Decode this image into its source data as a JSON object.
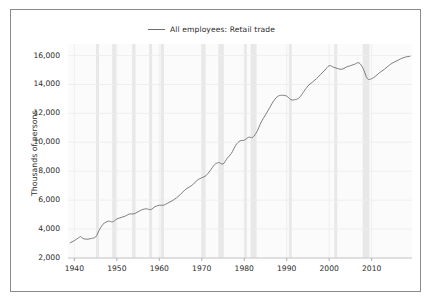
{
  "figure": {
    "background_color": "#ffffff",
    "border_color": "#8a8a8a",
    "plot_background_color": "#fbfbfb"
  },
  "legend": {
    "label": "All employees: Retail trade",
    "line_color": "#6f6f6f",
    "position": "top-center"
  },
  "axis": {
    "ylabel": "Thousands of persons",
    "xlabel": "",
    "ytick_labels": [
      "2,000",
      "4,000",
      "6,000",
      "8,000",
      "10,000",
      "12,000",
      "14,000",
      "16,000"
    ],
    "xtick_labels": [
      "1940",
      "1950",
      "1960",
      "1970",
      "1980",
      "1990",
      "2000",
      "2010"
    ]
  },
  "chart_data": {
    "type": "line",
    "title": "",
    "subtitle": "",
    "xlabel": "",
    "ylabel": "Thousands of persons",
    "xlim": [
      1938.5,
      2019.5
    ],
    "ylim": [
      2000,
      16800
    ],
    "yticks": [
      2000,
      4000,
      6000,
      8000,
      10000,
      12000,
      14000,
      16000
    ],
    "xticks": [
      1940,
      1950,
      1960,
      1970,
      1980,
      1990,
      2000,
      2010
    ],
    "grid": true,
    "legend_position": "upper center",
    "series": [
      {
        "name": "All employees: Retail trade",
        "color": "#6f6f6f",
        "units": "Thousands of persons",
        "x": [
          1939,
          1940,
          1941,
          1941.5,
          1942,
          1943,
          1944,
          1945,
          1945.8,
          1946.5,
          1947,
          1948,
          1949,
          1950,
          1951,
          1952,
          1953,
          1954,
          1955,
          1956,
          1957,
          1958,
          1959,
          1960,
          1961,
          1962,
          1963,
          1964,
          1965,
          1966,
          1967,
          1968,
          1969,
          1970,
          1971,
          1972,
          1973,
          1974,
          1975,
          1976,
          1977,
          1978,
          1979,
          1980,
          1981,
          1982,
          1983,
          1984,
          1985,
          1986,
          1987,
          1988,
          1989,
          1990,
          1991,
          1992,
          1993,
          1994,
          1995,
          1996,
          1997,
          1998,
          1999,
          2000,
          2001,
          2002,
          2003,
          2004,
          2005,
          2006,
          2007,
          2008,
          2009,
          2010,
          2011,
          2012,
          2013,
          2014,
          2015,
          2016,
          2017,
          2018,
          2019
        ],
        "y": [
          3050,
          3200,
          3400,
          3480,
          3350,
          3300,
          3350,
          3450,
          3900,
          4250,
          4400,
          4550,
          4500,
          4700,
          4800,
          4900,
          5050,
          5050,
          5200,
          5350,
          5400,
          5350,
          5550,
          5650,
          5650,
          5800,
          5950,
          6150,
          6400,
          6700,
          6900,
          7100,
          7400,
          7550,
          7700,
          8050,
          8450,
          8600,
          8500,
          8900,
          9250,
          9800,
          10100,
          10150,
          10350,
          10350,
          10750,
          11400,
          11900,
          12400,
          12900,
          13200,
          13250,
          13200,
          12950,
          12950,
          13100,
          13500,
          13900,
          14150,
          14400,
          14700,
          15000,
          15300,
          15200,
          15100,
          15050,
          15200,
          15300,
          15400,
          15500,
          15100,
          14400,
          14400,
          14600,
          14850,
          15050,
          15300,
          15500,
          15650,
          15800,
          15900,
          15950
        ]
      }
    ],
    "recession_bands": [
      {
        "start": 1945.1,
        "end": 1945.8
      },
      {
        "start": 1948.9,
        "end": 1949.8
      },
      {
        "start": 1953.6,
        "end": 1954.4
      },
      {
        "start": 1957.6,
        "end": 1958.3
      },
      {
        "start": 1960.3,
        "end": 1961.1
      },
      {
        "start": 1969.9,
        "end": 1970.9
      },
      {
        "start": 1973.9,
        "end": 1975.2
      },
      {
        "start": 1980.0,
        "end": 1980.6
      },
      {
        "start": 1981.5,
        "end": 1982.9
      },
      {
        "start": 1990.5,
        "end": 1991.2
      },
      {
        "start": 2001.2,
        "end": 2001.9
      },
      {
        "start": 2007.9,
        "end": 2009.5
      }
    ],
    "recession_band_color": "#e8e8e8"
  }
}
